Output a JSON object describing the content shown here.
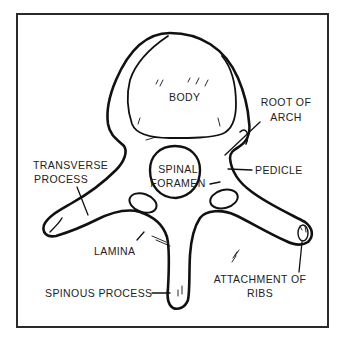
{
  "diagram": {
    "labels": {
      "body": "BODY",
      "root_of_arch_1": "ROOT OF",
      "root_of_arch_2": "ARCH",
      "transverse_process_1": "TRANSVERSE",
      "transverse_process_2": "PROCESS",
      "spinal_foramen_1": "SPINAL",
      "spinal_foramen_2": "FORAMEN",
      "pedicle": "PEDICLE",
      "lamina": "LAMINA",
      "spinous_process": "SPINOUS PROCESS",
      "attachment_of_ribs_1": "ATTACHMENT OF",
      "attachment_of_ribs_2": "RIBS"
    },
    "colors": {
      "line": "#111111",
      "frame": "#2a2a2a",
      "background": "#ffffff"
    }
  }
}
